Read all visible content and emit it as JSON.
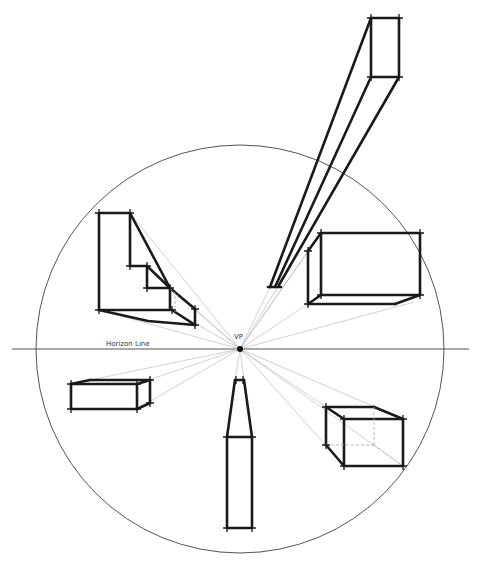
{
  "diagram": {
    "labels": {
      "horizon": "Horizon Line",
      "vanishing_point": "VP"
    },
    "colors": {
      "background": "#ffffff",
      "heavy_line": "#1a1a1a",
      "guide_line": "#bdbdbd",
      "circle": "#555555"
    },
    "vanishing_point": {
      "x": 240,
      "y": 349
    },
    "horizon_line": {
      "x1": 12,
      "x2": 469,
      "y": 349
    },
    "circle": {
      "cx": 240,
      "cy": 349,
      "r": 204
    },
    "objects": [
      {
        "name": "stair-block",
        "position": "upper-left"
      },
      {
        "name": "tall-box",
        "position": "upper-right"
      },
      {
        "name": "right-box",
        "position": "right"
      },
      {
        "name": "left-box",
        "position": "lower-left"
      },
      {
        "name": "bottom-box",
        "position": "bottom"
      },
      {
        "name": "cube",
        "position": "lower-right"
      }
    ]
  }
}
